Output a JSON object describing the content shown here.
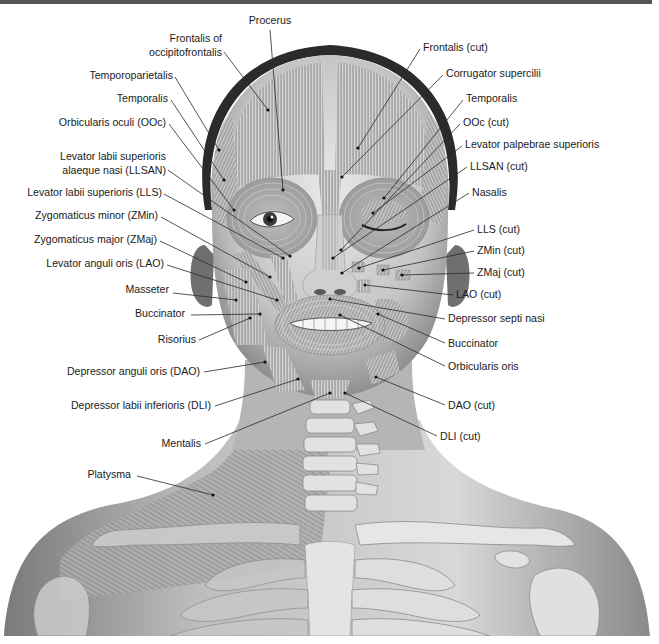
{
  "figure": {
    "colors": {
      "background": "#ffffff",
      "top_border": "#555555",
      "label_text": "#1a1a1a",
      "leader_line": "#2a2a2a",
      "skin_light": "#e6e6e6",
      "skin_mid": "#b9b9b9",
      "skin_dark": "#8c8c8c",
      "muscle": "#a8a8a8",
      "muscle_stripe": "#d2d2d2",
      "bone": "#e9e9e9",
      "hair": "#2b2b2b"
    }
  },
  "labels": {
    "top": [
      {
        "text": "Procerus",
        "x": 270,
        "y": 24,
        "anchor": "middle",
        "line": [
          270,
          30,
          283,
          190
        ]
      }
    ],
    "left": [
      {
        "lines": [
          "Frontalis of",
          "occipitofrontalis"
        ],
        "x": 222,
        "y": 42,
        "anchor": "end",
        "line": [
          224,
          52,
          268,
          110
        ]
      },
      {
        "lines": [
          "Temporoparietalis"
        ],
        "x": 173,
        "y": 79,
        "anchor": "end",
        "line": [
          175,
          77,
          219,
          150
        ]
      },
      {
        "lines": [
          "Temporalis"
        ],
        "x": 168,
        "y": 102,
        "anchor": "end",
        "line": [
          171,
          100,
          224,
          180
        ]
      },
      {
        "lines": [
          "Orbicularis oculi (OOc)"
        ],
        "x": 166,
        "y": 126,
        "anchor": "end",
        "line": [
          169,
          124,
          234,
          210
        ]
      },
      {
        "lines": [
          "Levator labii superioris",
          "alaeque nasi (LLSAN)"
        ],
        "x": 166,
        "y": 160,
        "anchor": "end",
        "line": [
          168,
          170,
          290,
          256
        ]
      },
      {
        "lines": [
          "Levator labii superioris (LLS)"
        ],
        "x": 162,
        "y": 196,
        "anchor": "end",
        "line": [
          164,
          194,
          283,
          258
        ]
      },
      {
        "lines": [
          "Zygomaticus minor (ZMin)"
        ],
        "x": 158,
        "y": 219,
        "anchor": "end",
        "line": [
          161,
          217,
          270,
          277
        ]
      },
      {
        "lines": [
          "Zygomaticus major (ZMaj)"
        ],
        "x": 157,
        "y": 243,
        "anchor": "end",
        "line": [
          160,
          241,
          246,
          282
        ]
      },
      {
        "lines": [
          "Levator anguli oris (LAO)"
        ],
        "x": 164,
        "y": 267,
        "anchor": "end",
        "line": [
          167,
          265,
          277,
          300
        ]
      },
      {
        "lines": [
          "Masseter"
        ],
        "x": 169,
        "y": 293,
        "anchor": "end",
        "line": [
          173,
          293,
          236,
          300
        ]
      },
      {
        "lines": [
          "Buccinator"
        ],
        "x": 185,
        "y": 317,
        "anchor": "end",
        "line": [
          191,
          315,
          260,
          314
        ]
      },
      {
        "lines": [
          "Risorius"
        ],
        "x": 196,
        "y": 343,
        "anchor": "end",
        "line": [
          199,
          340,
          250,
          318
        ]
      },
      {
        "lines": [
          "Depressor anguli oris (DAO)"
        ],
        "x": 200,
        "y": 375,
        "anchor": "end",
        "line": [
          204,
          372,
          265,
          362
        ]
      },
      {
        "lines": [
          "Depressor labii inferioris (DLI)"
        ],
        "x": 211,
        "y": 409,
        "anchor": "end",
        "line": [
          215,
          406,
          298,
          379
        ]
      },
      {
        "lines": [
          "Mentalis"
        ],
        "x": 201,
        "y": 447,
        "anchor": "end",
        "line": [
          205,
          444,
          330,
          393
        ]
      },
      {
        "lines": [
          "Platysma"
        ],
        "x": 131,
        "y": 478,
        "anchor": "end",
        "line": [
          137,
          476,
          213,
          495
        ]
      }
    ],
    "right": [
      {
        "lines": [
          "Frontalis (cut)"
        ],
        "x": 423,
        "y": 51,
        "anchor": "start",
        "line": [
          420,
          49,
          358,
          148
        ]
      },
      {
        "lines": [
          "Corrugator supercilii"
        ],
        "x": 446,
        "y": 77,
        "anchor": "start",
        "line": [
          443,
          75,
          342,
          177
        ]
      },
      {
        "lines": [
          "Temporalis"
        ],
        "x": 466,
        "y": 102,
        "anchor": "start",
        "line": [
          463,
          100,
          384,
          198
        ]
      },
      {
        "lines": [
          "OOc (cut)"
        ],
        "x": 463,
        "y": 126,
        "anchor": "start",
        "line": [
          460,
          124,
          341,
          250
        ]
      },
      {
        "lines": [
          "Levator palpebrae superioris"
        ],
        "x": 465,
        "y": 148,
        "anchor": "start",
        "line": [
          462,
          146,
          373,
          213
        ]
      },
      {
        "lines": [
          "LLSAN (cut)"
        ],
        "x": 470,
        "y": 170,
        "anchor": "start",
        "line": [
          467,
          167,
          333,
          258
        ]
      },
      {
        "lines": [
          "Nasalis"
        ],
        "x": 472,
        "y": 196,
        "anchor": "start",
        "line": [
          469,
          193,
          342,
          273
        ]
      },
      {
        "lines": [
          "LLS (cut)"
        ],
        "x": 477,
        "y": 233,
        "anchor": "start",
        "line": [
          474,
          230,
          359,
          268
        ]
      },
      {
        "lines": [
          "ZMin (cut)"
        ],
        "x": 477,
        "y": 254,
        "anchor": "start",
        "line": [
          474,
          251,
          383,
          270
        ]
      },
      {
        "lines": [
          "ZMaj (cut)"
        ],
        "x": 477,
        "y": 276,
        "anchor": "start",
        "line": [
          474,
          273,
          402,
          275
        ]
      },
      {
        "lines": [
          "LAO (cut)"
        ],
        "x": 456,
        "y": 298,
        "anchor": "start",
        "line": [
          453,
          295,
          365,
          285
        ]
      },
      {
        "lines": [
          "Depressor septi nasi"
        ],
        "x": 448,
        "y": 322,
        "anchor": "start",
        "line": [
          445,
          319,
          330,
          299
        ]
      },
      {
        "lines": [
          "Buccinator"
        ],
        "x": 448,
        "y": 347,
        "anchor": "start",
        "line": [
          445,
          343,
          378,
          314
        ]
      },
      {
        "lines": [
          "Orbicularis oris"
        ],
        "x": 448,
        "y": 370,
        "anchor": "start",
        "line": [
          445,
          366,
          340,
          315
        ]
      },
      {
        "lines": [
          "DAO (cut)"
        ],
        "x": 448,
        "y": 409,
        "anchor": "start",
        "line": [
          445,
          405,
          376,
          377
        ]
      },
      {
        "lines": [
          "DLI (cut)"
        ],
        "x": 440,
        "y": 440,
        "anchor": "start",
        "line": [
          437,
          436,
          345,
          393
        ]
      }
    ]
  }
}
